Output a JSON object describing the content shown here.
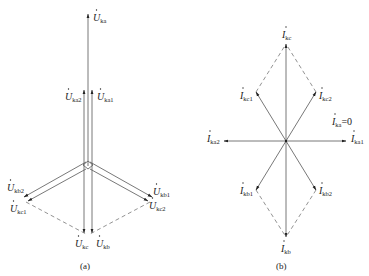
{
  "figure_a": {
    "caption": "(a)",
    "labels": {
      "U_ka": {
        "main": "U",
        "sub": "ka"
      },
      "U_ka1": {
        "main": "U",
        "sub": "ka1"
      },
      "U_ka2": {
        "main": "U",
        "sub": "ka2"
      },
      "U_kb1": {
        "main": "U",
        "sub": "kb1"
      },
      "U_kb2": {
        "main": "U",
        "sub": "kb2"
      },
      "U_kc1": {
        "main": "U",
        "sub": "kc1"
      },
      "U_kc2": {
        "main": "U",
        "sub": "kc2"
      },
      "U_kb": {
        "main": "U",
        "sub": "kb"
      },
      "U_kc": {
        "main": "U",
        "sub": "kc"
      }
    }
  },
  "figure_b": {
    "caption": "(b)",
    "labels": {
      "I_kc": {
        "main": "I",
        "sub": "kc"
      },
      "I_kc1": {
        "main": "I",
        "sub": "kc1"
      },
      "I_kc2": {
        "main": "I",
        "sub": "kc2"
      },
      "I_ka": {
        "main": "I",
        "sub": "ka",
        "suffix": "=0"
      },
      "I_ka1": {
        "main": "I",
        "sub": "ka1"
      },
      "I_ka2": {
        "main": "I",
        "sub": "ka2"
      },
      "I_kb1": {
        "main": "I",
        "sub": "kb1"
      },
      "I_kb2": {
        "main": "I",
        "sub": "kb2"
      },
      "I_kb": {
        "main": "I",
        "sub": "kb"
      }
    }
  }
}
